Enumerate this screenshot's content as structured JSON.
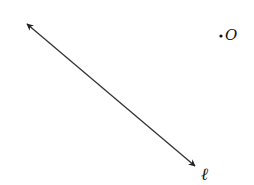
{
  "diagram": {
    "line": {
      "label": "ℓ",
      "start": [
        25,
        22
      ],
      "end": [
        197,
        168
      ],
      "color": "#333333",
      "arrows": "both"
    },
    "point": {
      "label": "O",
      "dot": [
        221,
        36
      ]
    }
  }
}
